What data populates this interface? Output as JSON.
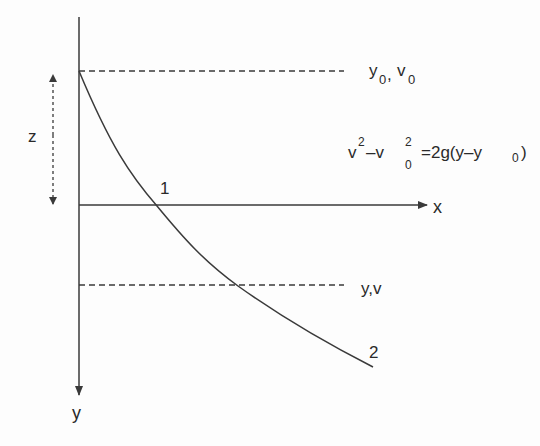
{
  "diagram": {
    "type": "free-fall trajectory diagram",
    "axes": {
      "x_label": "x",
      "y_label": "y",
      "origin_label": "1"
    },
    "levels": {
      "initial": {
        "label_main_1": "y",
        "label_sub_1": "0",
        "separator": ",",
        "label_main_2": "v",
        "label_sub_2": "0"
      },
      "final": {
        "label": "y,v"
      }
    },
    "height_marker": {
      "label": "z"
    },
    "curve": {
      "start_point_label": "1",
      "end_point_label": "2"
    },
    "equation": {
      "v": "v",
      "exp1": "2",
      "minus": "–v",
      "exp2": "2",
      "sub0": "0",
      "rhs_prefix": "=2g(y–y",
      "rhs_sub": "0",
      "rhs_suffix": ")"
    },
    "colors": {
      "line": "#3a3a3a",
      "text": "#2a2a2a",
      "background": "#fdfdfd"
    }
  }
}
